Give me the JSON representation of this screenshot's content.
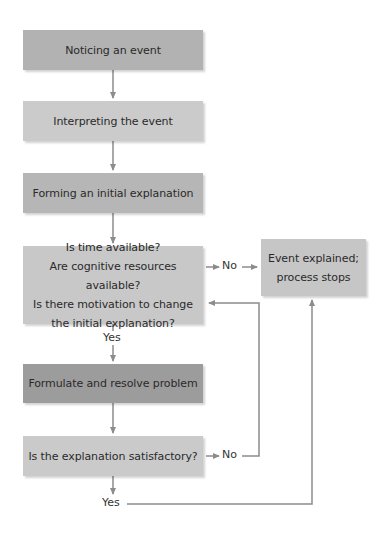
{
  "diagram": {
    "type": "flowchart",
    "line_color": "#8c8c8c",
    "nodes": [
      {
        "id": "notice",
        "label": "Noticing an event",
        "color": "#b2b2b2"
      },
      {
        "id": "interpret",
        "label": "Interpreting the event",
        "color": "#cbcbcb"
      },
      {
        "id": "form",
        "label": "Forming an initial explanation",
        "color": "#b6b6b6"
      },
      {
        "id": "decide",
        "lines": [
          "Is time available?",
          "Are cognitive resources available?",
          "Is there motivation to change",
          "the initial explanation?"
        ],
        "color": "#c8c8c8"
      },
      {
        "id": "explained",
        "lines": [
          "Event explained;",
          "process stops"
        ],
        "color": "#c6c6c6"
      },
      {
        "id": "formulate",
        "label": "Formulate and resolve problem",
        "color": "#9c9c9c"
      },
      {
        "id": "satisfactory",
        "label": "Is the explanation satisfactory?",
        "color": "#cacaca"
      }
    ],
    "edge_labels": {
      "decide_no": "No",
      "decide_yes": "Yes",
      "satisfactory_no": "No",
      "satisfactory_yes": "Yes"
    },
    "edges": [
      {
        "from": "notice",
        "to": "interpret"
      },
      {
        "from": "interpret",
        "to": "form"
      },
      {
        "from": "form",
        "to": "decide"
      },
      {
        "from": "decide",
        "to": "explained",
        "label": "No"
      },
      {
        "from": "decide",
        "to": "formulate",
        "label": "Yes"
      },
      {
        "from": "formulate",
        "to": "satisfactory"
      },
      {
        "from": "satisfactory",
        "to": "decide",
        "label": "No"
      },
      {
        "from": "satisfactory",
        "to": "explained",
        "label": "Yes"
      }
    ]
  }
}
